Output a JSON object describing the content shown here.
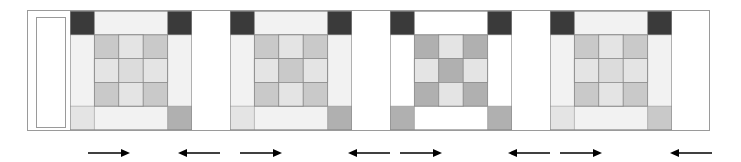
{
  "figure": {
    "width": 741,
    "height": 162,
    "background": "#ffffff",
    "frame": {
      "x": 27,
      "y": 10,
      "width": 683,
      "height": 121,
      "stroke": "#9a9a9a"
    }
  },
  "palette": {
    "white": "#ffffff",
    "off_white": "#f2f2f2",
    "very_light_gray": "#e4e4e4",
    "light_gray": "#dcdcdc",
    "medium_light_gray": "#c9c9c9",
    "medium_gray": "#b0b0b0",
    "mid_gray": "#a8a8a8",
    "dark_gray": "#6e6e6e",
    "very_dark_gray": "#3a3a3a",
    "outline": "#8a8a8a",
    "arrow": "#000000"
  },
  "strips": [
    {
      "name": "sashing-strip-left",
      "fill": "#ffffff",
      "stroke": "#9a9a9a",
      "x": 36,
      "y": 17,
      "width": 30,
      "height": 111
    }
  ],
  "blocks": [
    {
      "id": "block-1",
      "name": "snowball-nine-patch-block-1",
      "x": 70,
      "octagon_fill": "#a8a8a8",
      "background_fill": "#f2f2f2",
      "corner_dark_fill": "#3a3a3a",
      "corner_dark_positions": [
        "top-left",
        "top-right"
      ],
      "corner_medium_fill": "#b0b0b0",
      "corner_medium_positions": [
        "bottom-right"
      ],
      "corner_light_fill": "#e4e4e4",
      "corner_light_positions": [
        "bottom-left"
      ],
      "nine_patch": [
        [
          "#c9c9c9",
          "#e4e4e4",
          "#c9c9c9"
        ],
        [
          "#e4e4e4",
          "#dcdcdc",
          "#e4e4e4"
        ],
        [
          "#c9c9c9",
          "#e4e4e4",
          "#c9c9c9"
        ]
      ]
    },
    {
      "id": "block-2",
      "name": "snowball-nine-patch-block-2",
      "x": 230,
      "octagon_fill": "#6e6e6e",
      "background_fill": "#f2f2f2",
      "corner_dark_fill": "#3a3a3a",
      "corner_dark_positions": [
        "top-left",
        "top-right"
      ],
      "corner_medium_fill": "#b0b0b0",
      "corner_medium_positions": [
        "bottom-right"
      ],
      "corner_light_fill": "#e4e4e4",
      "corner_light_positions": [
        "bottom-left"
      ],
      "nine_patch": [
        [
          "#c9c9c9",
          "#e4e4e4",
          "#c9c9c9"
        ],
        [
          "#e4e4e4",
          "#c9c9c9",
          "#e4e4e4"
        ],
        [
          "#c9c9c9",
          "#e4e4e4",
          "#c9c9c9"
        ]
      ]
    },
    {
      "id": "block-3",
      "name": "snowball-nine-patch-block-3",
      "x": 390,
      "octagon_fill": "#e4e4e4",
      "background_fill": "#ffffff",
      "corner_dark_fill": "#3a3a3a",
      "corner_dark_positions": [
        "top-left",
        "top-right"
      ],
      "corner_medium_fill": "#b0b0b0",
      "corner_medium_positions": [
        "bottom-left",
        "bottom-right"
      ],
      "corner_light_fill": "#e4e4e4",
      "corner_light_positions": [],
      "nine_patch": [
        [
          "#b0b0b0",
          "#e4e4e4",
          "#b0b0b0"
        ],
        [
          "#e4e4e4",
          "#b0b0b0",
          "#e4e4e4"
        ],
        [
          "#b0b0b0",
          "#e4e4e4",
          "#b0b0b0"
        ]
      ]
    },
    {
      "id": "block-4",
      "name": "snowball-nine-patch-block-4",
      "x": 550,
      "octagon_fill": "#a8a8a8",
      "background_fill": "#f2f2f2",
      "corner_dark_fill": "#3a3a3a",
      "corner_dark_positions": [
        "top-left",
        "top-right"
      ],
      "corner_medium_fill": "#c9c9c9",
      "corner_medium_positions": [
        "bottom-right"
      ],
      "corner_light_fill": "#e4e4e4",
      "corner_light_positions": [
        "bottom-left"
      ],
      "nine_patch": [
        [
          "#c9c9c9",
          "#e4e4e4",
          "#c9c9c9"
        ],
        [
          "#e4e4e4",
          "#dcdcdc",
          "#e4e4e4"
        ],
        [
          "#c9c9c9",
          "#e4e4e4",
          "#c9c9c9"
        ]
      ]
    }
  ],
  "arrows": [
    {
      "id": "arrow-1",
      "name": "press-arrow-right-1",
      "direction": "right",
      "x": 88,
      "y": 146,
      "length": 42
    },
    {
      "id": "arrow-2",
      "name": "press-arrow-left-1",
      "direction": "left",
      "x": 178,
      "y": 146,
      "length": 42
    },
    {
      "id": "arrow-3",
      "name": "press-arrow-right-2",
      "direction": "right",
      "x": 240,
      "y": 146,
      "length": 42
    },
    {
      "id": "arrow-4",
      "name": "press-arrow-left-2",
      "direction": "left",
      "x": 348,
      "y": 146,
      "length": 42
    },
    {
      "id": "arrow-5",
      "name": "press-arrow-right-3",
      "direction": "right",
      "x": 400,
      "y": 146,
      "length": 42
    },
    {
      "id": "arrow-6",
      "name": "press-arrow-left-3",
      "direction": "left",
      "x": 508,
      "y": 146,
      "length": 42
    },
    {
      "id": "arrow-7",
      "name": "press-arrow-right-4",
      "direction": "right",
      "x": 560,
      "y": 146,
      "length": 42
    },
    {
      "id": "arrow-8",
      "name": "press-arrow-left-4",
      "direction": "left",
      "x": 670,
      "y": 146,
      "length": 42
    }
  ]
}
